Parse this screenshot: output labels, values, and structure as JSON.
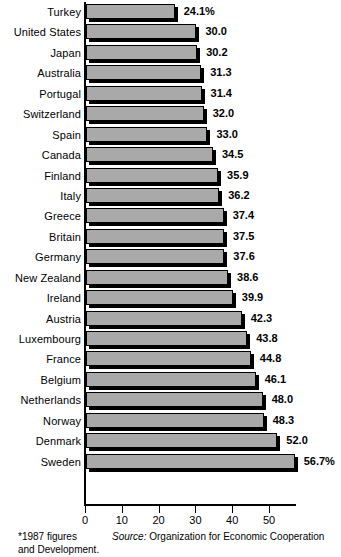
{
  "chart_data": {
    "type": "bar",
    "orientation": "horizontal",
    "title": "",
    "subtitle": "",
    "xlabel": "",
    "ylabel": "",
    "xlim": [
      0,
      58
    ],
    "grid": false,
    "legend": null,
    "axis_ticks": [
      0,
      10,
      20,
      30,
      40,
      50
    ],
    "tick_labels": [
      "0",
      "10",
      "20",
      "30",
      "40",
      "50"
    ],
    "categories": [
      "Turkey",
      "United States",
      "Japan",
      "Australia",
      "Portugal",
      "Switzerland",
      "Spain",
      "Canada",
      "Finland",
      "Italy",
      "Greece",
      "Britain",
      "Germany",
      "New Zealand",
      "Ireland",
      "Austria",
      "Luxembourg",
      "France",
      "Belgium",
      "Netherlands",
      "Norway",
      "Denmark",
      "Sweden"
    ],
    "values": [
      24.1,
      30.0,
      30.2,
      31.3,
      31.4,
      32.0,
      33.0,
      34.5,
      35.9,
      36.2,
      37.4,
      37.5,
      37.6,
      38.6,
      39.9,
      42.3,
      43.8,
      44.8,
      46.1,
      48.0,
      48.3,
      52.0,
      56.7
    ],
    "data_labels": [
      "24.1%",
      "30.0",
      "30.2",
      "31.3",
      "31.4",
      "32.0",
      "33.0",
      "34.5",
      "35.9",
      "36.2",
      "37.4",
      "37.5",
      "37.6",
      "38.6",
      "39.9",
      "42.3",
      "43.8",
      "44.8",
      "46.1",
      "48.0",
      "48.3",
      "52.0",
      "56.7%"
    ],
    "bar_color": "#a9a9a9",
    "bar_edge_color": "#000000",
    "shadow_color": "#000000"
  },
  "footer": {
    "footnote_line1": "*1987 figures",
    "footnote_line2": "and Development.",
    "source_keyword": "Source:",
    "source_text": " Organization for Economic Cooperation"
  }
}
